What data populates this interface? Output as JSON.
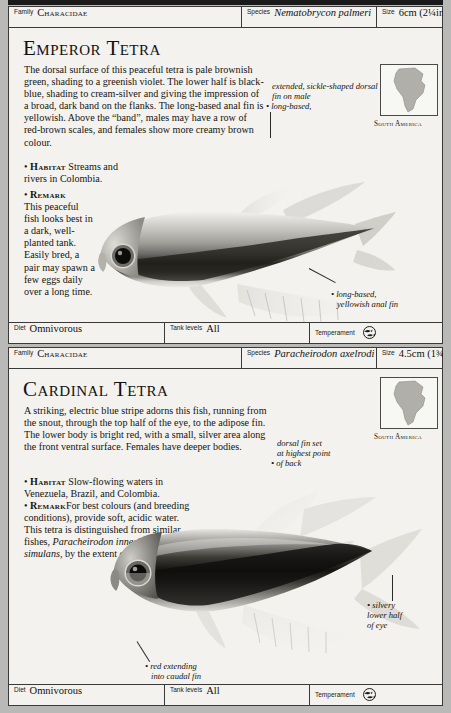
{
  "page": {
    "background_color": "#b9b9b7",
    "panel_color": "#f3f2ee",
    "rule_color": "#3a3a38"
  },
  "entries": [
    {
      "header": {
        "family_label": "Family",
        "family_value": "Characidae",
        "species_label": "Species",
        "species_value": "Nematobrycon palmeri",
        "size_label": "Size",
        "size_value": "6cm (2¼in)"
      },
      "title": "Emperor Tetra",
      "description": "The dorsal surface of this peaceful tetra is pale brownish green, shading to a greenish violet. The lower half is black-blue, shading to cream-silver and giving the impression of a broad, dark band on the flanks. The long-based anal fin is yellowish. Above the “band”, males may have a row of red-brown scales, and females show more creamy brown colour.",
      "habitat_label": "Habitat",
      "habitat_text": "Streams and rivers in Colombia.",
      "remark_label": "Remark",
      "remark_text": "This peaceful fish looks best in a dark, well-planted tank. Easily bred, a pair may spawn a few eggs daily over a long time.",
      "map_caption": "South America",
      "annotations": [
        "extended, sickle-shaped dorsal",
        "fin on male",
        "long-based,",
        "yellowish anal fin"
      ],
      "footer": {
        "diet_label": "Diet",
        "diet_value": "Omnivorous",
        "tank_label": "Tank levels",
        "tank_value": "All",
        "temperament_label": "Temperament",
        "temperament_icon": "fish-shoal-icon"
      }
    },
    {
      "header": {
        "family_label": "Family",
        "family_value": "Characidae",
        "species_label": "Species",
        "species_value": "Paracheirodon axelrodi",
        "size_label": "Size",
        "size_value": "4.5cm (1¾in)"
      },
      "title": "Cardinal Tetra",
      "description": "A striking, electric blue stripe adorns this fish, running from the snout, through the top half of the eye, to the adipose fin. The lower body is bright red, with a small, silver area along the front ventral surface. Females have deeper bodies.",
      "habitat_label": "Habitat",
      "habitat_text": "Slow-flowing waters in Venezuela, Brazil, and Colombia.",
      "remark_label": "Remark",
      "remark_text_1": "For best colours (and breeding conditions), provide soft, acidic water. This tetra is distinguished from similar fishes, ",
      "remark_italic_1": "Paracheirodon innesi",
      "remark_text_2": " and ",
      "remark_italic_2": "P. simulans",
      "remark_text_3": ", by the extent of the red band.",
      "map_caption": "South America",
      "annotations": [
        "dorsal fin set",
        "at highest point",
        "of back",
        "silvery",
        "lower half",
        "of eye",
        "red extending",
        "into caudal fin"
      ],
      "footer": {
        "diet_label": "Diet",
        "diet_value": "Omnivorous",
        "tank_label": "Tank levels",
        "tank_value": "All",
        "temperament_label": "Temperament",
        "temperament_icon": "fish-shoal-icon"
      }
    }
  ]
}
